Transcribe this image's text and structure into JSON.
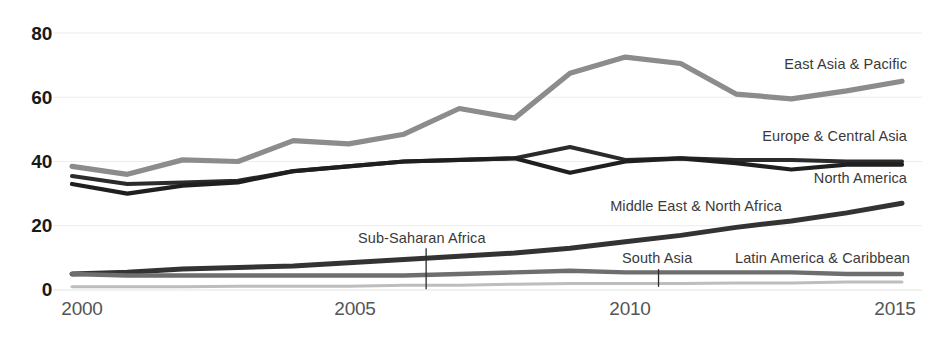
{
  "chart_data": {
    "type": "line",
    "title": "",
    "subtitle": "",
    "xlabel": "",
    "ylabel": "",
    "x": [
      2000,
      2001,
      2002,
      2003,
      2004,
      2005,
      2006,
      2007,
      2008,
      2009,
      2010,
      2011,
      2012,
      2013,
      2014,
      2015
    ],
    "xlim": [
      2000,
      2015
    ],
    "ylim": [
      0,
      80
    ],
    "xticks": [
      2000,
      2005,
      2010,
      2015
    ],
    "xtick_labels": [
      "2000",
      "2005",
      "2010",
      "2015"
    ],
    "yticks": [
      0,
      20,
      40,
      60,
      80
    ],
    "ytick_labels": [
      "0",
      "20",
      "40",
      "60",
      "80"
    ],
    "grid": "horizontal",
    "legend": "inline-labels-right",
    "series": [
      {
        "name": "East Asia & Pacific",
        "color": "#8c8c8c",
        "values": [
          38.5,
          36.0,
          40.5,
          40.0,
          46.5,
          45.5,
          48.5,
          56.5,
          53.5,
          67.5,
          72.5,
          70.5,
          61.0,
          59.5,
          62.0,
          65.0
        ]
      },
      {
        "name": "Europe & Central Asia",
        "color": "#2b2b2b",
        "values": [
          35.5,
          33.0,
          33.5,
          34.0,
          37.0,
          38.5,
          40.0,
          40.5,
          41.0,
          44.5,
          40.5,
          41.0,
          40.5,
          40.5,
          40.0,
          40.0
        ]
      },
      {
        "name": "North America",
        "color": "#1f1f1f",
        "values": [
          33.0,
          30.0,
          32.5,
          33.5,
          37.0,
          38.5,
          40.0,
          40.5,
          41.0,
          36.5,
          40.0,
          41.0,
          39.5,
          37.5,
          39.0,
          39.0
        ]
      },
      {
        "name": "Middle East & North Africa",
        "color": "#333333",
        "values": [
          5.0,
          5.5,
          6.5,
          7.0,
          7.5,
          8.5,
          9.5,
          10.5,
          11.5,
          13.0,
          15.0,
          17.0,
          19.5,
          21.5,
          24.0,
          27.0
        ]
      },
      {
        "name": "Latin America & Caribbean",
        "color": "#6e6e6e",
        "values": [
          5.0,
          4.5,
          4.5,
          4.5,
          4.5,
          4.5,
          4.5,
          5.0,
          5.5,
          6.0,
          5.5,
          5.5,
          5.5,
          5.5,
          5.0,
          5.0
        ]
      },
      {
        "name": "South Asia",
        "color": "#bdbdbd",
        "values": [
          1.0,
          1.0,
          1.0,
          1.2,
          1.2,
          1.2,
          1.5,
          1.5,
          1.8,
          2.0,
          2.0,
          2.0,
          2.2,
          2.2,
          2.5,
          2.5
        ]
      }
    ],
    "annotations": [
      {
        "text": "East Asia & Pacific",
        "x": 2014.0,
        "y": 66.5
      },
      {
        "text": "Europe & Central Asia",
        "x": 2014.0,
        "y": 44.0
      },
      {
        "text": "North America",
        "x": 2014.0,
        "y": 35.0
      },
      {
        "text": "Middle East & North Africa",
        "x": 2010.6,
        "y": 23.0
      },
      {
        "text": "Sub-Saharan Africa",
        "x": 2006.2,
        "y": 13.0,
        "leader": true
      },
      {
        "text": "South Asia",
        "x": 2010.6,
        "y": 8.0,
        "leader": true
      },
      {
        "text": "Latin America & Caribbean",
        "x": 2014.0,
        "y": 8.0
      }
    ]
  },
  "axis": {
    "y": {
      "t80": "80",
      "t60": "60",
      "t40": "40",
      "t20": "20",
      "t0": "0"
    },
    "x": {
      "t2000": "2000",
      "t2005": "2005",
      "t2010": "2010",
      "t2015": "2015"
    }
  },
  "labels": {
    "east_asia_pacific": "East Asia & Pacific",
    "europe_central_asia": "Europe & Central Asia",
    "north_america": "North America",
    "middle_east_north_africa": "Middle East & North Africa",
    "sub_saharan_africa": "Sub-Saharan Africa",
    "south_asia": "South Asia",
    "latin_america_caribbean": "Latin America & Caribbean"
  },
  "colors": {
    "gridline": "#ececec",
    "axis_text": "#555555",
    "tick_text": "#1a1a1a",
    "label_text": "#3a3a3a",
    "background": "#ffffff"
  }
}
